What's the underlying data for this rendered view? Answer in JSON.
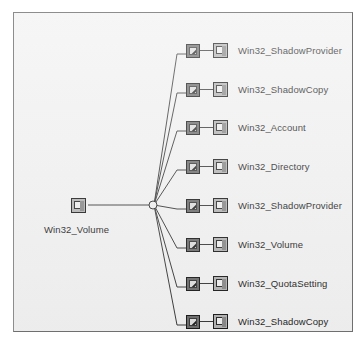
{
  "diagram": {
    "background_color": "#f1f1f1",
    "border_color": "#8d8d8d",
    "line_color": "#3a3a3a",
    "text_color": "#262626",
    "root": {
      "label": "Win32_Volume",
      "icon": "wmi-class-icon"
    },
    "hub": {
      "shape": "circle",
      "radius": 4
    },
    "rows": [
      {
        "label": "Win32_ShadowProvider",
        "association_icon": "wmi-association-icon",
        "class_icon": "wmi-class-icon",
        "y": 37
      },
      {
        "label": "Win32_ShadowCopy",
        "association_icon": "wmi-association-icon",
        "class_icon": "wmi-class-icon",
        "y": 76
      },
      {
        "label": "Win32_Account",
        "association_icon": "wmi-association-icon",
        "class_icon": "wmi-class-icon",
        "y": 114
      },
      {
        "label": "Win32_Directory",
        "association_icon": "wmi-association-icon",
        "class_icon": "wmi-class-icon",
        "y": 153
      },
      {
        "label": "Win32_ShadowProvider",
        "association_icon": "wmi-association-icon",
        "class_icon": "wmi-class-icon",
        "y": 192
      },
      {
        "label": "Win32_Volume",
        "association_icon": "wmi-association-icon",
        "class_icon": "wmi-class-icon",
        "y": 231
      },
      {
        "label": "Win32_QuotaSetting",
        "association_icon": "wmi-association-icon",
        "class_icon": "wmi-class-icon",
        "y": 270
      },
      {
        "label": "Win32_ShadowCopy",
        "association_icon": "wmi-association-icon",
        "class_icon": "wmi-class-icon",
        "y": 308
      }
    ]
  }
}
